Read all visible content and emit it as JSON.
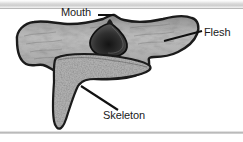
{
  "figure": {
    "name": "anatomical-cross-section-diagram",
    "background_color": "#ffffff",
    "ink_color": "#1a1a1a"
  },
  "labels": [
    {
      "id": "mouth",
      "text": "Mouth",
      "leader": "horizontal line pointing right toward dark oval opening",
      "target": "dark teardrop opening at top center of body"
    },
    {
      "id": "flesh",
      "text": "Flesh",
      "leader": "diagonal line pointing left-down into mottled gray outer body",
      "target": "mottled gray outer tissue mass"
    },
    {
      "id": "skeleton",
      "text": "Skeleton",
      "leader": "diagonal line pointing up-left into speckled triangular core",
      "target": "speckled triangular internal structure"
    }
  ],
  "regions": {
    "flesh": {
      "label": "Flesh",
      "fill_color": "#9b9b9b",
      "outline_color": "#1b1b1b",
      "texture": "mottled wavy light-and-dark gray streaks"
    },
    "skeleton": {
      "label": "Skeleton",
      "fill_color": "#8f8f8f",
      "outline_color": "#1b1b1b",
      "texture": "fine dark speckles / stippling"
    },
    "mouth": {
      "label": "Mouth",
      "fill_color": "#3a3a3a",
      "outline_color": "#111111",
      "texture": "dark shaded cavity with gradient"
    }
  },
  "page_artifacts": {
    "top_band": "light gray scanned page edge",
    "bottom_band": "thin gray scanned page edge"
  }
}
